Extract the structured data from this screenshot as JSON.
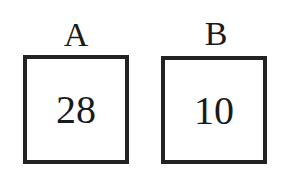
{
  "boxes": [
    {
      "label": "A",
      "value": "28"
    },
    {
      "label": "B",
      "value": "10"
    }
  ]
}
